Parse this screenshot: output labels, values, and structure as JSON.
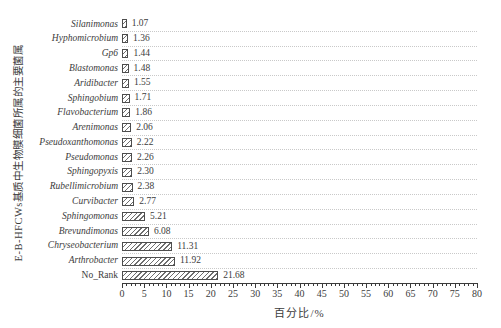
{
  "chart_data": {
    "type": "bar",
    "orientation": "horizontal",
    "title": "",
    "xlabel": "百分比/%",
    "ylabel": "E-B-HFCWs基质中生物膜细菌所属的主要菌属",
    "xlim": [
      0,
      80
    ],
    "x_major_ticks": [
      0,
      5,
      10,
      15,
      20,
      25,
      30,
      35,
      40,
      45,
      50,
      55,
      60,
      65,
      70,
      75,
      80
    ],
    "x_minor_tick_step": 1,
    "grid": "horizontal dotted line under each category row",
    "legend": "none",
    "bar_style": "white fill with diagonal line hatch, dark outline",
    "categories": [
      "Silanimonas",
      "Hyphomicrobium",
      "Gp6",
      "Blastomonas",
      "Aridibacter",
      "Sphingobium",
      "Flavobacterium",
      "Arenimonas",
      "Pseudoxanthomonas",
      "Pseudomonas",
      "Sphingopyxis",
      "Rubellimicrobium",
      "Curvibacter",
      "Sphingomonas",
      "Brevundimonas",
      "Chryseobacterium",
      "Arthrobacter",
      "No_Rank"
    ],
    "values": [
      1.07,
      1.36,
      1.44,
      1.48,
      1.55,
      1.71,
      1.86,
      2.06,
      2.22,
      2.26,
      2.3,
      2.38,
      2.77,
      5.21,
      6.08,
      11.31,
      11.92,
      21.68
    ],
    "value_labels": [
      "1.07",
      "1.36",
      "1.44",
      "1.48",
      "1.55",
      "1.71",
      "1.86",
      "2.06",
      "2.22",
      "2.26",
      "2.30",
      "2.38",
      "2.77",
      "5.21",
      "6.08",
      "11.31",
      "11.92",
      "21.68"
    ],
    "italic_category_names": true,
    "upright_categories": [
      "No_Rank"
    ]
  },
  "colors": {
    "background": "#ffffff",
    "text": "#3c3c3c",
    "axis": "#3a3a3a",
    "bar_outline": "#4d4d4d",
    "bar_hatch": "#6e6e6e",
    "gridline": "#c9c9c9"
  }
}
